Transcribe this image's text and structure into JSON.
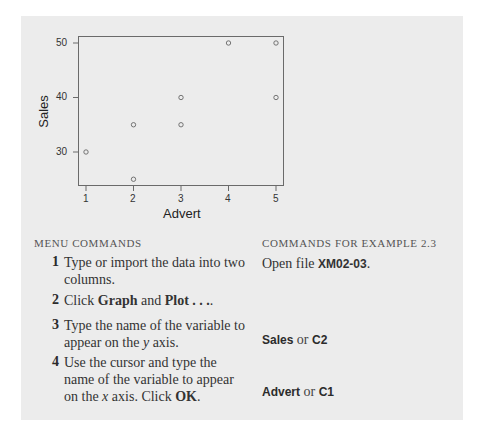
{
  "chart_data": {
    "type": "scatter",
    "title": "",
    "xlabel": "Advert",
    "ylabel": "Sales",
    "x": [
      1,
      2,
      2,
      3,
      3,
      4,
      5,
      5
    ],
    "y": [
      30,
      35,
      25,
      40,
      35,
      50,
      50,
      40
    ],
    "xticks": [
      "1",
      "2",
      "3",
      "4",
      "5"
    ],
    "yticks": [
      "30",
      "40",
      "50"
    ],
    "xlim": [
      0.83,
      5.17
    ],
    "ylim": [
      23.8,
      51.3
    ],
    "grid": false,
    "marker": "open-circle",
    "legend": null
  },
  "left_column": {
    "heading": "MENU COMMANDS",
    "steps": [
      {
        "num": "1",
        "lines": [
          "Type or import the data into two",
          "columns."
        ]
      },
      {
        "num": "2",
        "pre": "Click ",
        "b1": "Graph",
        "mid": " and ",
        "b2": "Plot . . .",
        "post": "."
      },
      {
        "num": "3",
        "lines": [
          "Type the name of the variable to",
          "appear on the "
        ],
        "italic": "y",
        "tail": " axis."
      },
      {
        "num": "4",
        "lines": [
          "Use the cursor and type the",
          "name of the variable to appear",
          "on the "
        ],
        "italic": "x",
        "tail": " axis. Click ",
        "bold_tail": "OK",
        "end": "."
      }
    ]
  },
  "right_column": {
    "heading": "COMMANDS FOR EXAMPLE 2.3",
    "open_file_pre": "Open file ",
    "open_file_name": "XM02-03",
    "open_file_post": ".",
    "y_var": {
      "name": "Sales",
      "or": " or ",
      "col": "C2"
    },
    "x_var": {
      "name": "Advert",
      "or": " or ",
      "col": "C1"
    }
  }
}
